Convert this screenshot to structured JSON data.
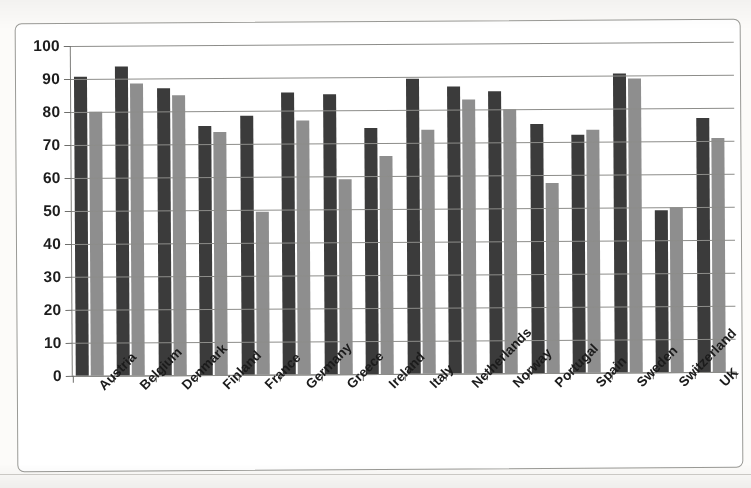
{
  "chart_data": {
    "type": "bar",
    "title": "",
    "subtitle": "",
    "xlabel": "",
    "ylabel": "",
    "ylim": [
      0,
      100
    ],
    "ytick_step": 10,
    "yticks": [
      "0",
      "10",
      "20",
      "30",
      "40",
      "50",
      "60",
      "70",
      "80",
      "90",
      "100"
    ],
    "grid": true,
    "legend": "none",
    "orientation": "vertical",
    "bar_style": "grouped",
    "categories": [
      "Austria",
      "Belgium",
      "Denmark",
      "Finland",
      "France",
      "Germany",
      "Greece",
      "Ireland",
      "Italy",
      "Netherlands",
      "Norway",
      "Portugal",
      "Spain",
      "Sweden",
      "Switzerland",
      "UK"
    ],
    "series": [
      {
        "name": "Series 1",
        "color": "#3b3b3b",
        "values": [
          90.5,
          93.5,
          87.0,
          75.5,
          78.5,
          85.5,
          85.0,
          74.5,
          89.5,
          87.0,
          85.5,
          75.5,
          72.0,
          90.5,
          49.0,
          77.0
        ]
      },
      {
        "name": "Series 2",
        "color": "#8e8e8e",
        "values": [
          80.0,
          88.5,
          85.0,
          73.5,
          49.5,
          77.0,
          59.0,
          66.0,
          74.0,
          83.0,
          80.0,
          57.5,
          73.5,
          89.0,
          50.0,
          71.0
        ]
      }
    ]
  },
  "colors": {
    "series_dark": "#3b3b3b",
    "series_light": "#8e8e8e",
    "gridline": "#8d8d8a",
    "axis": "#6f6f6c",
    "frame": "#9a9a96",
    "text": "#1b1b1b",
    "page_background": "#fcfbf9"
  }
}
